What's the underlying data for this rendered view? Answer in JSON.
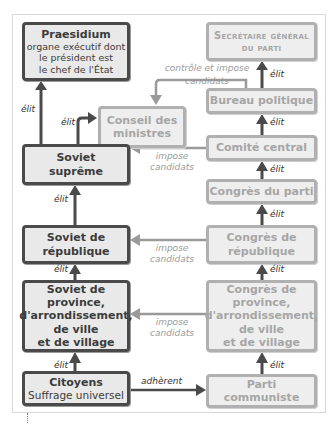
{
  "diagram": {
    "left_column": {
      "praesidium": {
        "title": "Praesidium",
        "lines": [
          "organe exécutif dont",
          "le président est",
          "le chef de l'État"
        ]
      },
      "conseil": {
        "lines": [
          "Conseil des",
          "ministres"
        ]
      },
      "soviet_supreme": {
        "lines": [
          "Soviet",
          "suprême"
        ]
      },
      "soviet_republique": {
        "lines": [
          "Soviet de",
          "république"
        ]
      },
      "soviet_province": {
        "lines": [
          "Soviet de",
          "province,",
          "d'arrondissement,",
          "de ville",
          "et de village"
        ]
      },
      "citoyens": {
        "title": "Citoyens",
        "subtitle": "Suffrage universel"
      }
    },
    "right_column": {
      "secretaire": {
        "lines": [
          "Secrétaire général",
          "du parti"
        ]
      },
      "bureau": {
        "label": "Bureau politique"
      },
      "comite": {
        "label": "Comité central"
      },
      "congres_parti": {
        "label": "Congrès du parti"
      },
      "congres_republique": {
        "lines": [
          "Congrès de",
          "république"
        ]
      },
      "congres_province": {
        "lines": [
          "Congrès de",
          "province,",
          "d'arrondissement,",
          "de ville",
          "et de village"
        ]
      },
      "parti": {
        "lines": [
          "Parti",
          "communiste"
        ]
      }
    },
    "labels": {
      "elit": "élit",
      "adherent": "adhèrent",
      "controle_line1": "contrôle et impose",
      "controle_line2": "candidats",
      "impose_line1": "impose",
      "impose_line2": "candidats"
    },
    "colors": {
      "dark_border": "#4a4a4a",
      "light_border": "#b0b0b0",
      "box_fill": "#e9e9e9",
      "dark_text": "#3c3c3c",
      "light_text": "#a6a6a6"
    }
  }
}
